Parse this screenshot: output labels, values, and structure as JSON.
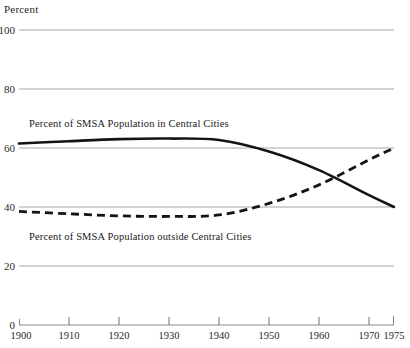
{
  "chart_data": {
    "type": "line",
    "title": "",
    "xlabel": "",
    "ylabel": "Percent",
    "ylim": [
      0,
      100
    ],
    "xlim": [
      1900,
      1975
    ],
    "grid": true,
    "legend_position": "inline-annotations",
    "y_ticks": [
      "100",
      "80",
      "60",
      "40",
      "20",
      "0"
    ],
    "y_tick_values": [
      100,
      80,
      60,
      40,
      20,
      0
    ],
    "x_ticks": [
      "1900",
      "1910",
      "1920",
      "1930",
      "1940",
      "1950",
      "1960",
      "1970",
      "1975"
    ],
    "x_tick_values": [
      1900,
      1910,
      1920,
      1930,
      1940,
      1950,
      1960,
      1970,
      1975
    ],
    "series": [
      {
        "name": "Percent of SMSA Population in Central Cities",
        "style": "solid",
        "color": "#141414",
        "x": [
          1900,
          1910,
          1920,
          1930,
          1940,
          1950,
          1960,
          1970,
          1975
        ],
        "values": [
          61.5,
          62.3,
          63.0,
          63.2,
          62.7,
          58.8,
          52.5,
          44.0,
          40.0
        ]
      },
      {
        "name": "Percent of SMSA Population outside Central Cities",
        "style": "dashed",
        "color": "#141414",
        "x": [
          1900,
          1910,
          1920,
          1930,
          1940,
          1950,
          1960,
          1970,
          1975
        ],
        "values": [
          38.5,
          37.7,
          37.0,
          36.8,
          37.3,
          41.2,
          47.5,
          56.0,
          60.0
        ]
      }
    ],
    "annotations": [
      {
        "text": "Percent of SMSA Population in Central Cities",
        "x": 1900,
        "y": 68,
        "px": 29,
        "py": 127
      },
      {
        "text": "Percent of SMSA Population outside Central Cities",
        "x": 1900,
        "y": 33,
        "px": 29,
        "py": 240
      }
    ]
  }
}
